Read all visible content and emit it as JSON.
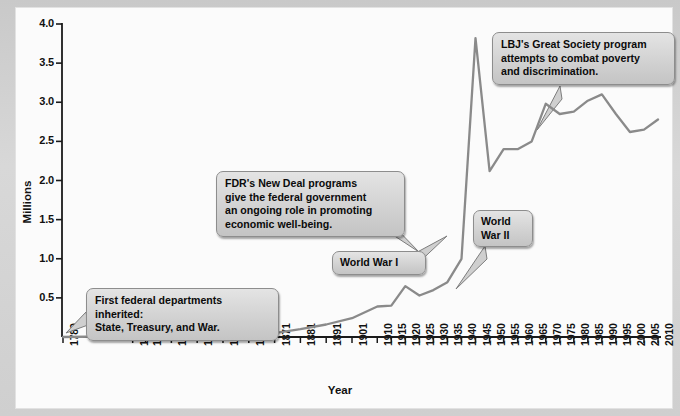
{
  "chart_data": {
    "type": "line",
    "title": "",
    "xlabel": "Year",
    "ylabel": "Millions",
    "ylim": [
      0,
      4.0
    ],
    "yticks": [
      "0.5",
      "1.0",
      "1.5",
      "2.0",
      "2.5",
      "3.0",
      "3.5",
      "4.0"
    ],
    "ytick_values": [
      0.5,
      1.0,
      1.5,
      2.0,
      2.5,
      3.0,
      3.5,
      4.0
    ],
    "grid": false,
    "legend": null,
    "categories": [
      "1789",
      "1816",
      "1821",
      "1831",
      "1841",
      "1851",
      "1861",
      "1871",
      "1881",
      "1891",
      "1901",
      "1910",
      "1915",
      "1920",
      "1925",
      "1930",
      "1935",
      "1940",
      "1945",
      "1950",
      "1955",
      "1960",
      "1965",
      "1970",
      "1975",
      "1980",
      "1985",
      "1990",
      "1995",
      "2000",
      "2005",
      "2010"
    ],
    "series": [
      {
        "name": "Federal civilian employment",
        "values": [
          0.0,
          0.01,
          0.01,
          0.02,
          0.02,
          0.03,
          0.04,
          0.05,
          0.1,
          0.16,
          0.24,
          0.39,
          0.4,
          0.65,
          0.53,
          0.6,
          0.7,
          1.0,
          3.82,
          2.12,
          2.4,
          2.4,
          2.5,
          2.98,
          2.85,
          2.88,
          3.02,
          3.1,
          2.85,
          2.62,
          2.65,
          2.78
        ]
      }
    ],
    "annotations": [
      {
        "id": "first-departments",
        "text": "First federal departments inherited:\nState, Treasury, and War.",
        "anchor_year": "1789",
        "anchor_value": 0.0
      },
      {
        "id": "world-war-1",
        "text": "World War I",
        "anchor_year": "1918",
        "anchor_value": 0.85
      },
      {
        "id": "fdr-new-deal",
        "text": "FDR's New Deal programs\ngive the federal government\nan ongoing role in promoting\neconomic well-being.",
        "anchor_year": "1933",
        "anchor_value": 0.7
      },
      {
        "id": "world-war-2",
        "text": "World\nWar II",
        "anchor_year": "1943",
        "anchor_value": 3.0
      },
      {
        "id": "lbj-great-society",
        "text": "LBJ's Great Society program\nattempts to combat poverty\nand discrimination.",
        "anchor_year": "1965",
        "anchor_value": 2.55
      }
    ],
    "colors": {
      "line": "#8a8a8a",
      "axis": "#1a1a1a",
      "panel_bg": "#fbfbfb",
      "frame_bg": "#d2d2d2",
      "callout_bg": "#d6d6d6",
      "callout_border": "#8d8d8d",
      "text": "#111111"
    }
  }
}
